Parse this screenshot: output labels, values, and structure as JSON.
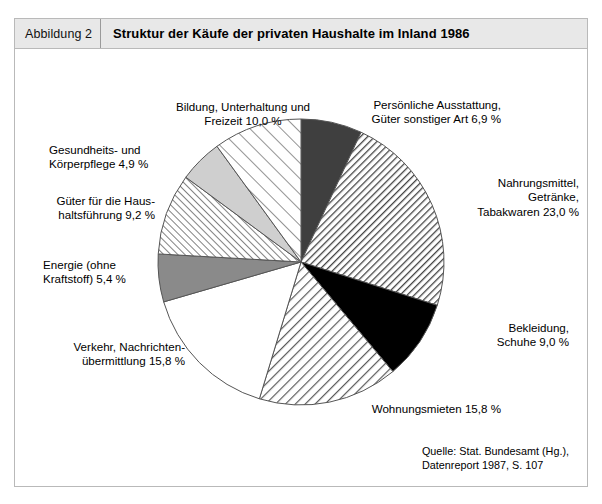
{
  "header": {
    "index_label": "Abbildung 2",
    "title": "Struktur der Käufe der privaten Haushalte im Inland 1986"
  },
  "source": {
    "text": "Quelle: Stat. Bundesamt (Hg.),\n            Datenreport 1987, S. 107"
  },
  "chart_data": {
    "type": "pie",
    "title": "Struktur der Käufe der privaten Haushalte im Inland 1986",
    "unit": "%",
    "start_angle_deg": 0,
    "direction": "clockwise",
    "legend_position": "labels-around-pie",
    "categories": [
      "Persönliche Ausstattung, Güter sonstiger Art",
      "Nahrungsmittel, Getränke, Tabakwaren",
      "Bekleidung, Schuhe",
      "Wohnungsmieten",
      "Verkehr, Nachrichtenübermittlung",
      "Energie (ohne Kraftstoff)",
      "Güter für die Haushaltsführung",
      "Gesundheits- und Körperpflege",
      "Bildung, Unterhaltung und Freizeit"
    ],
    "values": [
      6.9,
      23.0,
      9.0,
      15.8,
      15.8,
      5.4,
      9.2,
      4.9,
      10.0
    ],
    "slices": [
      {
        "label": "Persönliche Ausstattung,\nGüter sonstiger Art 6,9 %",
        "name": "Persönliche Ausstattung, Güter sonstiger Art",
        "value": 6.9,
        "fill": "#3f3f3f",
        "style": "solid-dark-gray"
      },
      {
        "label": "Nahrungsmittel,\nGetränke,\nTabakwaren 23,0 %",
        "name": "Nahrungsmittel, Getränke, Tabakwaren",
        "value": 23.0,
        "fill": "#ffffff",
        "style": "hatch-dense"
      },
      {
        "label": "Bekleidung,\nSchuhe 9,0 %",
        "name": "Bekleidung, Schuhe",
        "value": 9.0,
        "fill": "#000000",
        "style": "solid-black"
      },
      {
        "label": "Wohnungsmieten 15,8 %",
        "name": "Wohnungsmieten",
        "value": 15.8,
        "fill": "#ffffff",
        "style": "hatch-medium"
      },
      {
        "label": "Verkehr, Nachrichten-\nübermittlung 15,8 %",
        "name": "Verkehr, Nachrichtenübermittlung",
        "value": 15.8,
        "fill": "#ffffff",
        "style": "plain-white"
      },
      {
        "label": "Energie (ohne\nKraftstoff) 5,4 %",
        "name": "Energie (ohne Kraftstoff)",
        "value": 5.4,
        "fill": "#8a8a8a",
        "style": "solid-mid-gray"
      },
      {
        "label": "Güter für die Haus-\nhaltsführung 9,2 %",
        "name": "Güter für die Haushaltsführung",
        "value": 9.2,
        "fill": "#ffffff",
        "style": "hatch-fine"
      },
      {
        "label": "Gesundheits- und\nKörperpflege 4,9 %",
        "name": "Gesundheits- und Körperpflege",
        "value": 4.9,
        "fill": "#cfcfcf",
        "style": "solid-light-gray"
      },
      {
        "label": "Bildung, Unterhaltung und\nFreizeit 10,0 %",
        "name": "Bildung, Unterhaltung und Freizeit",
        "value": 10.0,
        "fill": "#ffffff",
        "style": "hatch-sparse"
      }
    ]
  },
  "colors": {
    "frame_border": "#b9b9b9",
    "header_background": "#e8e8e8",
    "page_background": "#ffffff",
    "stroke": "#555555"
  }
}
